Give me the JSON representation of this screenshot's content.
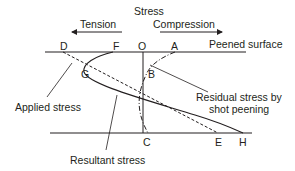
{
  "title": "Stress",
  "direction_labels": {
    "tension": "Tension",
    "compression": "Compression"
  },
  "surface_label": "Peened surface",
  "points": {
    "D": "D",
    "F": "F",
    "O": "O",
    "A": "A",
    "G": "G",
    "B": "B",
    "C": "C",
    "E": "E",
    "H": "H"
  },
  "callouts": {
    "applied_stress": "Applied stress",
    "resultant_stress": "Resultant stress",
    "residual_line1": "Residual stress by",
    "residual_line2": "shot peening"
  },
  "colors": {
    "line": "#231f20",
    "background": "#ffffff"
  },
  "curves": [
    {
      "name": "Applied stress",
      "style": "dashed",
      "from": "D",
      "to": "E"
    },
    {
      "name": "Residual stress by shot peening",
      "style": "dash-dot",
      "through": [
        "A",
        "B",
        "C"
      ]
    },
    {
      "name": "Resultant stress",
      "style": "solid",
      "through": [
        "F",
        "G",
        "H"
      ]
    }
  ]
}
